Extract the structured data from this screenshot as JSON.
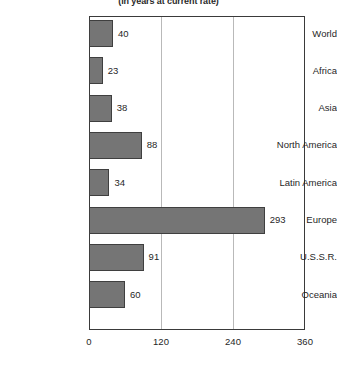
{
  "subtitle": "(in years at current rate)",
  "colors": {
    "bar_fill": "#757575",
    "bar_stroke": "#3f3f3f",
    "frame": "#3a3a3a",
    "gridline": "#b9b9b9",
    "text": "#1f1f1f"
  },
  "chart_data": {
    "type": "bar",
    "orientation": "horizontal",
    "title": "",
    "subtitle": "(in years at current rate)",
    "xlabel": "",
    "ylabel": "",
    "categories": [
      "World",
      "Africa",
      "Asia",
      "North America",
      "Latin America",
      "Europe",
      "U.S.S.R.",
      "Oceania"
    ],
    "values": [
      40,
      23,
      38,
      88,
      34,
      293,
      91,
      60
    ],
    "data_labels": [
      "40",
      "23",
      "38",
      "88",
      "34",
      "293",
      "91",
      "60"
    ],
    "xlim": [
      0,
      360
    ],
    "xticks": [
      0,
      120,
      240,
      360
    ],
    "xtick_labels": [
      "0",
      "120",
      "240",
      "360"
    ],
    "grid": true,
    "grid_axis": "x",
    "legend": false
  }
}
